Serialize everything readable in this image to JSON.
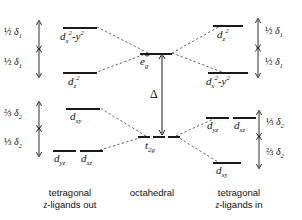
{
  "figure": {
    "type": "energy-level-diagram"
  },
  "columns": {
    "left": {
      "line1": "tetragonal",
      "line2_italic": "z",
      "line2_rest": "-ligands out"
    },
    "center": {
      "line1": "octahedral"
    },
    "right": {
      "line1": "tetragonal",
      "line2_italic": "z",
      "line2_rest": "-ligands in"
    }
  },
  "center_levels": {
    "eg": {
      "label_base": "e",
      "label_sub": "g",
      "label_star": "*"
    },
    "t2g": {
      "label_base": "t",
      "label_sub": "2g"
    },
    "gap": {
      "label": "Δ"
    }
  },
  "left_eg_block": {
    "upper": {
      "base": "d",
      "sub": "x",
      "sup1": "2",
      "mid": "-y",
      "sup2": "2"
    },
    "lower": {
      "base": "d",
      "sub": "z",
      "sup1": "2"
    },
    "measure_upper": {
      "fraction": "½",
      "symbol": "δ",
      "sub": "1"
    },
    "measure_lower": {
      "fraction": "½",
      "symbol": "δ",
      "sub": "1"
    }
  },
  "left_t2g_block": {
    "upper": {
      "base": "d",
      "sub": "xy"
    },
    "lower_a": {
      "base": "d",
      "sub": "yz"
    },
    "lower_b": {
      "base": "d",
      "sub": "xz"
    },
    "measure_upper": {
      "fraction": "⅔",
      "symbol": "δ",
      "sub": "2"
    },
    "measure_lower": {
      "fraction": "⅓",
      "symbol": "δ",
      "sub": "2"
    }
  },
  "right_eg_block": {
    "upper": {
      "base": "d",
      "sub": "z",
      "sup1": "2"
    },
    "lower": {
      "base": "d",
      "sub": "x",
      "sup1": "2",
      "mid": "-y",
      "sup2": "2"
    },
    "measure_upper": {
      "fraction": "½",
      "symbol": "δ",
      "sub": "1"
    },
    "measure_lower": {
      "fraction": "½",
      "symbol": "δ",
      "sub": "1"
    }
  },
  "right_t2g_block": {
    "upper_a": {
      "base": "d",
      "sub": "yz"
    },
    "upper_b": {
      "base": "d",
      "sub": "xz"
    },
    "lower": {
      "base": "d",
      "sub": "xy"
    },
    "measure_upper": {
      "fraction": "⅓",
      "symbol": "δ",
      "sub": "2"
    },
    "measure_lower": {
      "fraction": "⅔",
      "symbol": "δ",
      "sub": "2"
    }
  },
  "colors": {
    "ink": "#1a1a1a",
    "background": "#ffffff",
    "correlation_line": "#555555"
  }
}
